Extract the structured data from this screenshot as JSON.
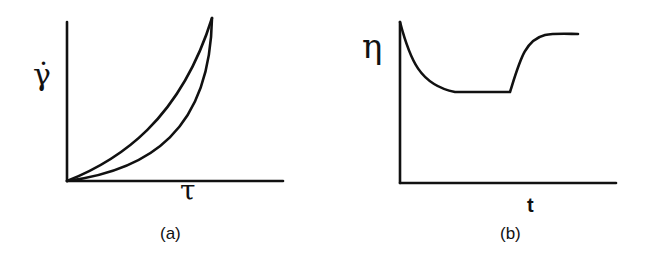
{
  "panels": [
    {
      "id": "a",
      "caption": "(a)",
      "y_label": "γ̇",
      "x_label": "τ",
      "description": "Hysteresis loop of shear rate vs shear stress: two curves from origin diverging and meeting at top right"
    },
    {
      "id": "b",
      "caption": "(b)",
      "y_label": "η",
      "x_label": "t",
      "description": "Viscosity vs time: decay to plateau, then recovery rise to a higher plateau"
    }
  ],
  "colors": {
    "ink": "#111111",
    "background": "#ffffff"
  }
}
